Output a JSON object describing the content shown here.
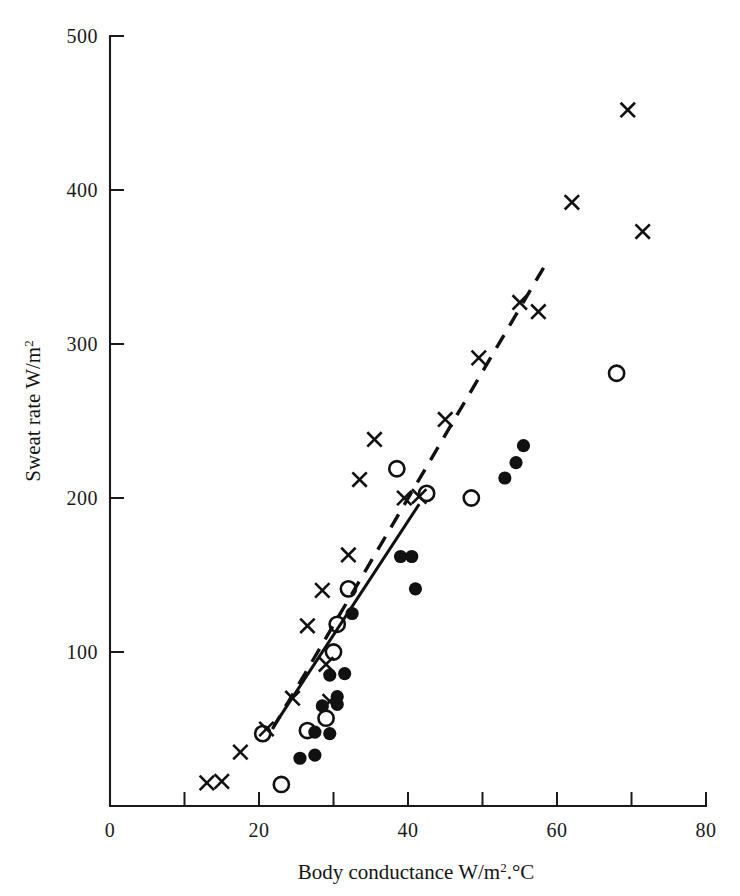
{
  "figure": {
    "background": "#ffffff",
    "ink_color": "#111111"
  },
  "axes": {
    "x_title_main": "Body conductance W/m",
    "x_title_sup": "2",
    "x_title_tail": ".°C",
    "y_title_main": "Sweat rate W/m",
    "y_title_sup": "2",
    "x_tick_labels": [
      "0",
      "20",
      "40",
      "60",
      "80"
    ],
    "y_tick_labels": [
      "100",
      "200",
      "300",
      "400",
      "500"
    ]
  },
  "chart_data": {
    "type": "scatter",
    "title": "",
    "xlabel": "Body conductance W/m².°C",
    "ylabel": "Sweat rate W/m²",
    "xlim": [
      0,
      80
    ],
    "ylim": [
      0,
      500
    ],
    "xticks": [
      0,
      10,
      20,
      30,
      40,
      50,
      60,
      70,
      80
    ],
    "xticklabels": [
      "0",
      "",
      "20",
      "",
      "40",
      "",
      "60",
      "",
      "80"
    ],
    "yticks": [
      100,
      200,
      300,
      400,
      500
    ],
    "yticklabels": [
      "100",
      "200",
      "300",
      "400",
      "500"
    ],
    "grid": false,
    "legend": "none",
    "series": [
      {
        "name": "cross",
        "marker": "x",
        "fill": "none",
        "points": [
          [
            13.0,
            15
          ],
          [
            15.0,
            16
          ],
          [
            17.5,
            35
          ],
          [
            21.0,
            50
          ],
          [
            24.5,
            70
          ],
          [
            26.5,
            117
          ],
          [
            28.5,
            140
          ],
          [
            29.0,
            92
          ],
          [
            29.5,
            68
          ],
          [
            32.0,
            163
          ],
          [
            33.5,
            212
          ],
          [
            35.5,
            238
          ],
          [
            39.5,
            200
          ],
          [
            41.5,
            201
          ],
          [
            45.0,
            251
          ],
          [
            49.5,
            291
          ],
          [
            55.0,
            327
          ],
          [
            57.5,
            321
          ],
          [
            62.0,
            392
          ],
          [
            69.5,
            452
          ],
          [
            71.5,
            373
          ]
        ]
      },
      {
        "name": "open-circle",
        "marker": "o",
        "fill": "none",
        "points": [
          [
            23.0,
            14
          ],
          [
            20.5,
            47
          ],
          [
            26.5,
            49
          ],
          [
            29.0,
            57
          ],
          [
            30.0,
            100
          ],
          [
            30.5,
            118
          ],
          [
            32.0,
            141
          ],
          [
            38.5,
            219
          ],
          [
            42.5,
            203
          ],
          [
            48.5,
            200
          ],
          [
            68.0,
            281
          ]
        ]
      },
      {
        "name": "filled-circle",
        "marker": "●",
        "fill": "#111111",
        "points": [
          [
            25.5,
            31
          ],
          [
            27.5,
            33
          ],
          [
            27.5,
            48
          ],
          [
            29.5,
            47
          ],
          [
            28.5,
            65
          ],
          [
            30.5,
            66
          ],
          [
            29.5,
            85
          ],
          [
            31.5,
            86
          ],
          [
            30.5,
            71
          ],
          [
            32.5,
            125
          ],
          [
            39.0,
            162
          ],
          [
            40.5,
            162
          ],
          [
            41.0,
            141
          ],
          [
            53.0,
            213
          ],
          [
            54.5,
            223
          ],
          [
            55.5,
            234
          ]
        ]
      }
    ],
    "fit_lines": [
      {
        "name": "solid-regression-line",
        "style": "solid",
        "x0": 22.0,
        "y0": 52,
        "x1": 41.5,
        "y1": 196
      },
      {
        "name": "dashed-regression-line",
        "style": "dashed",
        "x0": 21.8,
        "y0": 50,
        "x1": 58.5,
        "y1": 352
      }
    ]
  }
}
